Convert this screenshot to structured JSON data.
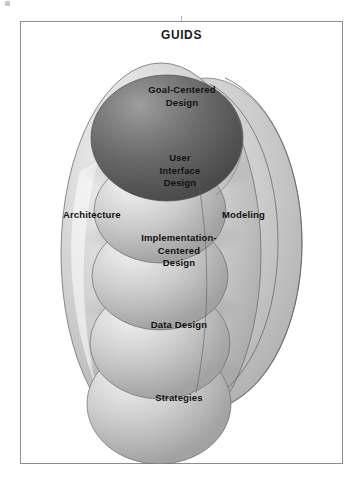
{
  "figure": {
    "title": "GUIDS",
    "kind": "concentric-sphere-stack-diagram",
    "frame": {
      "border_color": "#8d8d8d",
      "background": "#ffffff"
    }
  },
  "colors": {
    "dark_sphere": "#5f5f5f",
    "dark_sphere_highlight": "#9a9a9a",
    "light_sphere": "#c4c4c4",
    "light_sphere_highlight": "#efefef",
    "outer_ellipse": "#c6c6c6",
    "outer_ellipse_highlight": "#f2f2f2",
    "outline": "#6b6b6b",
    "text": "#121212"
  },
  "spheres": [
    {
      "id": "goal-centered-design",
      "label": "Goal-Centered\nDesign",
      "lines": [
        "Goal-Centered",
        "Design"
      ],
      "shade": "dark",
      "order": 1
    },
    {
      "id": "user-interface-design",
      "label": "User Interface Design",
      "lines": [
        "User",
        "Interface",
        "Design"
      ],
      "shade": "light",
      "order": 2
    },
    {
      "id": "implementation-centered-design",
      "label": "Implementation-Centered Design",
      "lines": [
        "Implementation-",
        "Centered",
        "Design"
      ],
      "shade": "light",
      "order": 3
    },
    {
      "id": "data-design",
      "label": "Data Design",
      "lines": [
        "Data Design"
      ],
      "shade": "light",
      "order": 4
    },
    {
      "id": "strategies",
      "label": "Strategies",
      "lines": [
        "Strategies"
      ],
      "shade": "light",
      "order": 5
    }
  ],
  "side_labels": {
    "left": "Architecture",
    "right": "Modeling"
  },
  "sphere_text": {
    "s1l1": "Goal-Centered",
    "s1l2": "Design",
    "s2l1": "User",
    "s2l2": "Interface",
    "s2l3": "Design",
    "s3l1": "Implementation-",
    "s3l2": "Centered",
    "s3l3": "Design",
    "s4l1": "Data Design",
    "s5l1": "Strategies"
  }
}
